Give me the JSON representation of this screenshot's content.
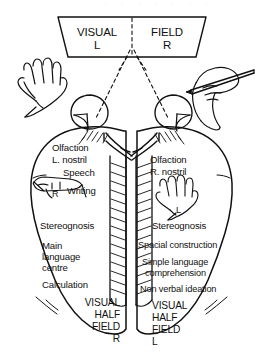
{
  "figure": {
    "background_color": "#ffffff",
    "ink_color": "#111111",
    "faint_artifact": "· ·  · ·    ·   ·   ·"
  },
  "visual_field_box": {
    "left_label": "VISUAL",
    "left_side": "L",
    "right_label": "FIELD",
    "right_side": "R"
  },
  "hands": {
    "outer_left": {
      "name": "left-hand-open",
      "label": ""
    },
    "outer_right": {
      "name": "right-hand-writing-pen",
      "label": ""
    },
    "inner_left_hemisphere": {
      "name": "right-hand-small",
      "label": "R"
    },
    "inner_right_hemisphere": {
      "name": "left-hand-small",
      "label": "L"
    }
  },
  "left_hemisphere": {
    "olfaction": "Olfaction",
    "nostril": "L. nostril",
    "speech": "Speech",
    "writing": "Writing",
    "stereognosis": "Stereognosis",
    "language_1": "Main",
    "language_2": "language",
    "language_3": "centre",
    "calculation": "Calculation",
    "visual_half_field": [
      "VISUAL",
      "HALF",
      "FIELD",
      "R"
    ]
  },
  "right_hemisphere": {
    "olfaction": "Olfaction",
    "nostril": "R. nostril",
    "stereognosis": "Stereognosis",
    "spacial_construction": "Spacial construction",
    "simple_language_1": "Simple language",
    "simple_language_2": "comprehension",
    "non_verbal_ideation": "Non verbal ideation",
    "visual_half_field": [
      "VISUAL",
      "HALF",
      "FIELD",
      "L"
    ]
  }
}
